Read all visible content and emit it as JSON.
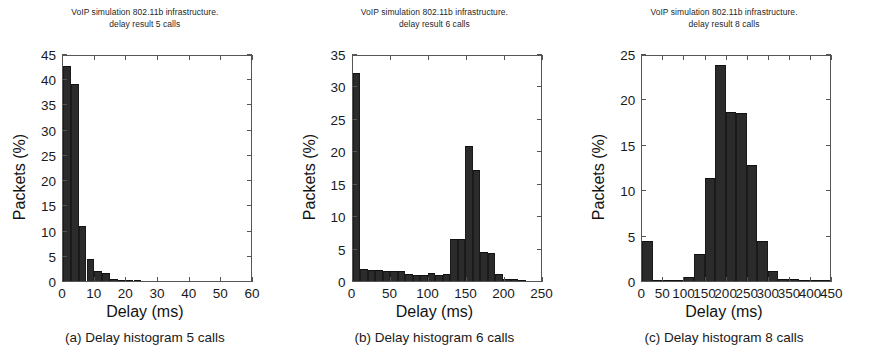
{
  "figure": {
    "shared_title_line1": "VoIP simulation 802.11b infrastructure.",
    "xlabel": "Delay (ms)",
    "ylabel": "Packets (%)",
    "bar_color": "#2b2b2b",
    "axis_color": "#555555"
  },
  "chart_data": [
    {
      "type": "bar",
      "panel_id": "a",
      "title": "VoIP simulation 802.11b infrastructure.",
      "subtitle": "delay result 5 calls",
      "caption": "(a) Delay histogram 5 calls",
      "xlabel": "Delay (ms)",
      "ylabel": "Packets (%)",
      "xlim": [
        0,
        60
      ],
      "ylim": [
        0,
        45
      ],
      "xticks": [
        0,
        10,
        20,
        30,
        40,
        50,
        60
      ],
      "yticks": [
        0,
        5,
        10,
        15,
        20,
        25,
        30,
        35,
        40,
        45
      ],
      "bin_width": 2.5,
      "bin_starts": [
        0,
        2.5,
        5,
        7.5,
        10,
        12.5,
        15,
        17.5,
        20,
        22.5
      ],
      "values": [
        43,
        39.5,
        11,
        4.5,
        2,
        1.6,
        0.5,
        0.2,
        0.1,
        0.05
      ],
      "grid": false,
      "legend": null
    },
    {
      "type": "bar",
      "panel_id": "b",
      "title": "VoIP simulation 802.11b infrastructure.",
      "subtitle": "delay result 6 calls",
      "caption": "(b) Delay histogram 6 calls",
      "xlabel": "Delay (ms)",
      "ylabel": "Packets (%)",
      "xlim": [
        0,
        250
      ],
      "ylim": [
        0,
        35
      ],
      "xticks": [
        0,
        50,
        100,
        150,
        200,
        250
      ],
      "yticks": [
        0,
        5,
        10,
        15,
        20,
        25,
        30,
        35
      ],
      "bin_width": 10,
      "bin_starts": [
        0,
        10,
        20,
        30,
        40,
        50,
        60,
        70,
        80,
        90,
        100,
        110,
        120,
        130,
        140,
        150,
        160,
        170,
        180,
        190,
        200,
        210,
        220
      ],
      "values": [
        32.4,
        1.9,
        1.7,
        1.7,
        1.6,
        1.6,
        1.6,
        1.1,
        1.0,
        1.0,
        1.3,
        1.0,
        1.1,
        6.5,
        6.6,
        21.0,
        17.3,
        4.5,
        4.4,
        1.1,
        0.3,
        0.3,
        0.2
      ],
      "grid": false,
      "legend": null
    },
    {
      "type": "bar",
      "panel_id": "c",
      "title": "VoIP simulation 802.11b infrastructure.",
      "subtitle": "delay result 8 calls",
      "caption": "(c) Delay histogram 8 calls",
      "xlabel": "Delay (ms)",
      "ylabel": "Packets (%)",
      "xlim": [
        0,
        450
      ],
      "ylim": [
        0,
        25
      ],
      "xticks": [
        0,
        50,
        100,
        150,
        200,
        250,
        300,
        350,
        400,
        450
      ],
      "yticks": [
        0,
        5,
        10,
        15,
        20,
        25
      ],
      "bin_width": 25,
      "bin_starts": [
        0,
        25,
        50,
        75,
        100,
        125,
        150,
        175,
        200,
        225,
        250,
        275,
        300,
        325,
        350,
        375,
        400,
        425
      ],
      "values": [
        4.5,
        0.15,
        0.1,
        0.1,
        0.4,
        3.0,
        11.5,
        24.0,
        18.8,
        18.7,
        12.9,
        4.4,
        1.1,
        0.2,
        0.2,
        0.15,
        0.1,
        0.05
      ],
      "grid": false,
      "legend": null
    }
  ]
}
